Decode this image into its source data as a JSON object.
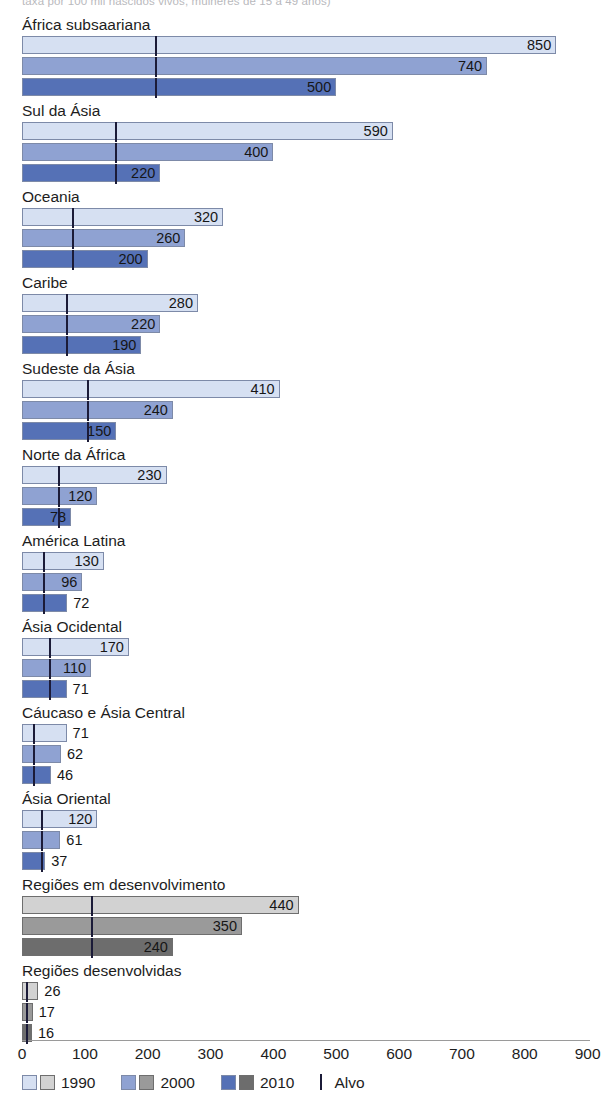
{
  "caption": {
    "cropped_text": "taxa por 100 mil nascidos vivos, mulheres de 15 a 49 anos)"
  },
  "legend": {
    "items": [
      {
        "label": "1990",
        "blue": "#d6e0f2",
        "gray": "#d2d2d2"
      },
      {
        "label": "2000",
        "blue": "#8fa2d2",
        "gray": "#9a9a9a"
      },
      {
        "label": "2010",
        "blue": "#5571b6",
        "gray": "#6d6d6d"
      }
    ],
    "target_label": "Alvo",
    "target_color": "#1b1b38"
  },
  "axis": {
    "ticks": [
      "0",
      "100",
      "200",
      "300",
      "400",
      "500",
      "600",
      "700",
      "800",
      "900"
    ],
    "min": 0,
    "max": 900
  },
  "chart_data": {
    "type": "bar",
    "orientation": "horizontal",
    "title": "",
    "xlabel": "",
    "ylabel": "",
    "xlim": [
      0,
      900
    ],
    "grid": false,
    "legend_position": "bottom",
    "series": [
      {
        "name": "1990",
        "color_blue": "#d6e0f2",
        "color_gray": "#d2d2d2"
      },
      {
        "name": "2000",
        "color_blue": "#8fa2d2",
        "color_gray": "#9a9a9a"
      },
      {
        "name": "2010",
        "color_blue": "#5571b6",
        "color_gray": "#6d6d6d"
      }
    ],
    "categories": [
      "África subsaariana",
      "Sul da Ásia",
      "Oceania",
      "Caribe",
      "Sudeste da Ásia",
      "Norte da África",
      "América Latina",
      "Ásia Ocidental",
      "Cáucaso e Ásia Central",
      "Ásia Oriental",
      "Regiões em desenvolvimento",
      "Regiões desenvolvidas"
    ],
    "groups": [
      {
        "label": "África subsaariana",
        "palette": "blue",
        "values": [
          850,
          740,
          500
        ],
        "target": 212
      },
      {
        "label": "Sul da Ásia",
        "palette": "blue",
        "values": [
          590,
          400,
          220
        ],
        "target": 148
      },
      {
        "label": "Oceania",
        "palette": "blue",
        "values": [
          320,
          260,
          200
        ],
        "target": 80
      },
      {
        "label": "Caribe",
        "palette": "blue",
        "values": [
          280,
          220,
          190
        ],
        "target": 70
      },
      {
        "label": "Sudeste da Ásia",
        "palette": "blue",
        "values": [
          410,
          240,
          150
        ],
        "target": 103
      },
      {
        "label": "Norte da África",
        "palette": "blue",
        "values": [
          230,
          120,
          78
        ],
        "target": 58
      },
      {
        "label": "América Latina",
        "palette": "blue",
        "values": [
          130,
          96,
          72
        ],
        "target": 33
      },
      {
        "label": "Ásia Ocidental",
        "palette": "blue",
        "values": [
          170,
          110,
          71
        ],
        "target": 43
      },
      {
        "label": "Cáucaso e Ásia Central",
        "palette": "blue",
        "values": [
          71,
          62,
          46
        ],
        "target": 18
      },
      {
        "label": "Ásia Oriental",
        "palette": "blue",
        "values": [
          120,
          61,
          37
        ],
        "target": 30
      },
      {
        "label": "Regiões em desenvolvimento",
        "palette": "gray",
        "values": [
          440,
          350,
          240
        ],
        "target": 110
      },
      {
        "label": "Regiões desenvolvidas",
        "palette": "gray",
        "values": [
          26,
          17,
          16
        ],
        "target": 6.5
      }
    ]
  }
}
